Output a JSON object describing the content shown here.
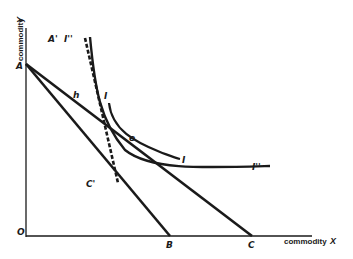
{
  "diagram": {
    "axes": {
      "x_label": "commodity",
      "x_var": "X",
      "y_label": "commodity",
      "y_var": "Y",
      "origin": "O"
    },
    "points": {
      "A": "A",
      "A_prime": "A'",
      "B": "B",
      "C": "C",
      "C_prime": "C'",
      "h": "h",
      "e": "e"
    },
    "curves": {
      "I_start": "I",
      "I_end": "I",
      "I2_start": "I''",
      "I2_end": "I''"
    },
    "colors": {
      "ink": "#1a1a1a",
      "background": "#ffffff"
    }
  }
}
